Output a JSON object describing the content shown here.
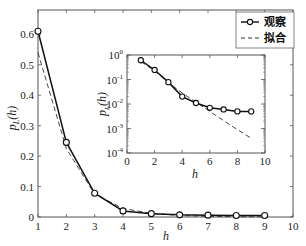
{
  "chart_data": [
    {
      "type": "line",
      "role": "main",
      "title": "",
      "xlabel": "h",
      "ylabel": "p_L(h)",
      "xlim": [
        1,
        10
      ],
      "ylim": [
        0,
        0.68
      ],
      "xticks": [
        1,
        2,
        3,
        4,
        5,
        6,
        7,
        8,
        9,
        10
      ],
      "yticks": [
        0,
        0.1,
        0.2,
        0.3,
        0.4,
        0.5,
        0.6
      ],
      "ytick_labels": [
        "0",
        "0.1",
        "0.2",
        "0.3",
        "0.4",
        "0.5",
        "0.6"
      ],
      "grid": false,
      "legend_position": "upper right",
      "x": [
        1,
        2,
        3,
        4,
        5,
        6,
        7,
        8,
        9
      ],
      "series": [
        {
          "name": "观察",
          "style": "solid-circle-markers",
          "values": [
            0.61,
            0.245,
            0.078,
            0.02,
            0.011,
            0.007,
            0.006,
            0.005,
            0.005
          ]
        },
        {
          "name": "拟合",
          "style": "dashed",
          "values": [
            0.54,
            0.225,
            0.075,
            0.028,
            0.012,
            0.005,
            0.0021,
            0.0009,
            0.0004
          ]
        }
      ]
    },
    {
      "type": "line",
      "role": "inset",
      "title": "",
      "xlabel": "h",
      "ylabel": "p_L(h)",
      "yscale": "log",
      "xlim": [
        0,
        10
      ],
      "ylim": [
        0.0001,
        1
      ],
      "xticks": [
        0,
        2,
        4,
        6,
        8,
        10
      ],
      "yticks": [
        1,
        0.1,
        0.01,
        0.001,
        0.0001
      ],
      "ytick_labels": [
        "10^0",
        "10^-1",
        "10^-2",
        "10^-3",
        "10^-4"
      ],
      "grid": false,
      "x": [
        1,
        2,
        3,
        4,
        5,
        6,
        7,
        8,
        9
      ],
      "series": [
        {
          "name": "观察",
          "style": "solid-circle-markers",
          "values": [
            0.61,
            0.245,
            0.078,
            0.02,
            0.011,
            0.007,
            0.006,
            0.005,
            0.005
          ]
        },
        {
          "name": "拟合",
          "style": "dashed",
          "values": [
            0.54,
            0.225,
            0.075,
            0.028,
            0.012,
            0.005,
            0.0021,
            0.0009,
            0.0004
          ]
        }
      ]
    }
  ],
  "legend": {
    "observed_label": "观察",
    "fit_label": "拟合"
  },
  "labels": {
    "main_xlabel": "h",
    "main_ylabel_p": "p",
    "main_ylabel_sub": "L",
    "main_ylabel_arg": "(h)",
    "inset_xlabel": "h"
  },
  "colors": {
    "axis": "#555555",
    "observed": "#111111",
    "fit": "#333333"
  }
}
